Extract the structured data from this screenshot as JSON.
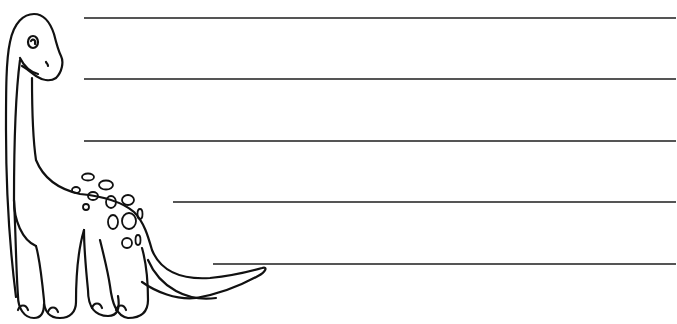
{
  "page": {
    "type": "writing-paper",
    "illustration": "dinosaur-icon",
    "line_color": "#555555",
    "outline_color": "#111111"
  },
  "writing_lines": [
    {
      "y": 18,
      "x_start": 84,
      "x_end": 676
    },
    {
      "y": 79,
      "x_start": 84,
      "x_end": 676
    },
    {
      "y": 141,
      "x_start": 84,
      "x_end": 676
    },
    {
      "y": 202,
      "x_start": 173,
      "x_end": 676
    },
    {
      "y": 264,
      "x_start": 213,
      "x_end": 676
    }
  ]
}
